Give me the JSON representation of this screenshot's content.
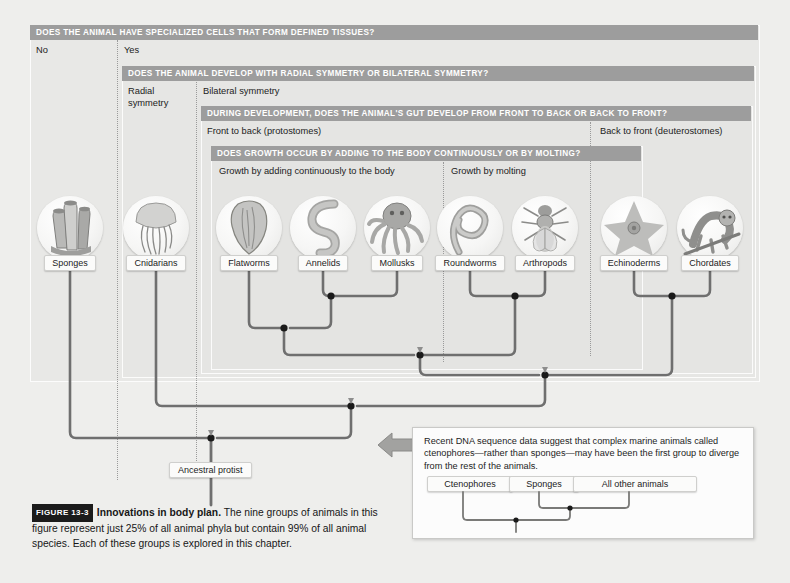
{
  "figure": {
    "badge": "FIGURE 13-3",
    "title": "Innovations in body plan.",
    "caption": "The nine groups of animals in this figure represent just 25% of all animal phyla but contain 99% of all animal species. Each of these groups is explored in this chapter."
  },
  "questions": [
    {
      "bar": "DOES THE ANIMAL HAVE SPECIALIZED CELLS THAT FORM DEFINED TISSUES?",
      "answers": [
        "No",
        "Yes"
      ]
    },
    {
      "bar": "DOES THE ANIMAL DEVELOP WITH RADIAL SYMMETRY OR BILATERAL SYMMETRY?",
      "answers": [
        "Radial\nsymmetry",
        "Bilateral symmetry"
      ]
    },
    {
      "bar": "DURING DEVELOPMENT, DOES THE ANIMAL'S GUT DEVELOP FROM FRONT TO BACK OR BACK TO FRONT?",
      "answers": [
        "Front to back (protostomes)",
        "Back to front (deuterostomes)"
      ]
    },
    {
      "bar": "DOES GROWTH OCCUR BY ADDING TO THE BODY CONTINUOUSLY OR BY MOLTING?",
      "answers": [
        "Growth by adding continuously to the body",
        "Growth by molting"
      ]
    }
  ],
  "taxa": [
    {
      "label": "Sponges",
      "icon": "sponge-icon"
    },
    {
      "label": "Cnidarians",
      "icon": "jellyfish-icon"
    },
    {
      "label": "Flatworms",
      "icon": "flatworm-icon"
    },
    {
      "label": "Annelids",
      "icon": "earthworm-icon"
    },
    {
      "label": "Mollusks",
      "icon": "octopus-icon"
    },
    {
      "label": "Roundworms",
      "icon": "roundworm-icon"
    },
    {
      "label": "Arthropods",
      "icon": "insect-icon"
    },
    {
      "label": "Echinoderms",
      "icon": "seastar-icon"
    },
    {
      "label": "Chordates",
      "icon": "monkey-icon"
    }
  ],
  "root_label": "Ancestral protist",
  "inset": {
    "text": "Recent DNA sequence data suggest that complex marine animals called ctenophores—rather than sponges—may have been the first group to diverge from the rest of the animals.",
    "taxa": [
      "Ctenophores",
      "Sponges",
      "All other animals"
    ]
  },
  "colors": {
    "question_bar": "#9d9d9d",
    "branch": "#6f6f6f",
    "node": "#1a1a1a",
    "background": "#eeeeec",
    "arrow": "#9a9a9a"
  },
  "tree_data": {
    "type": "cladogram",
    "tips": [
      "Sponges",
      "Cnidarians",
      "Flatworms",
      "Annelids",
      "Mollusks",
      "Roundworms",
      "Arthropods",
      "Echinoderms",
      "Chordates"
    ],
    "tip_x": [
      70,
      156,
      249,
      323,
      397,
      470,
      545,
      634,
      710
    ],
    "tip_y": 270,
    "nodes": [
      {
        "name": "lophotrochozoa-annelids-mollusks",
        "y": 296,
        "x": 331,
        "children_x": [
          323,
          397
        ]
      },
      {
        "name": "ecdysozoa",
        "y": 296,
        "x": 515,
        "children_x": [
          470,
          545
        ]
      },
      {
        "name": "deuterostomes",
        "y": 296,
        "x": 672,
        "children_x": [
          634,
          710
        ]
      },
      {
        "name": "protostomes-continuous",
        "y": 328,
        "x": 284,
        "children_x": [
          249,
          331
        ]
      },
      {
        "name": "protostomes",
        "y": 355,
        "x": 420,
        "children_x": [
          284,
          515
        ]
      },
      {
        "name": "bilateria",
        "y": 375,
        "x": 545,
        "children_x": [
          420,
          672
        ]
      },
      {
        "name": "eumetazoa",
        "y": 406,
        "x": 351,
        "children_x": [
          156,
          545
        ]
      },
      {
        "name": "animalia-root",
        "y": 438,
        "x": 211,
        "children_x": [
          70,
          351
        ]
      }
    ],
    "root_stem_bottom_y": 505
  }
}
